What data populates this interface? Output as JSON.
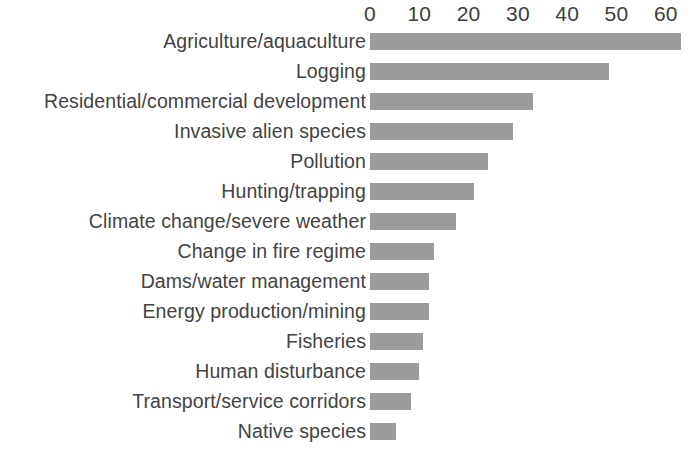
{
  "chart_data": {
    "type": "bar",
    "orientation": "horizontal",
    "title": "",
    "subtitle": "",
    "xlabel": "",
    "ylabel": "",
    "xlim": [
      0,
      63
    ],
    "x_ticks": [
      0,
      10,
      20,
      30,
      40,
      50,
      60
    ],
    "x_tick_labels": [
      "0",
      "10",
      "20",
      "30",
      "40",
      "50",
      "60"
    ],
    "grid": false,
    "legend": null,
    "bar_color": "#9c9c9c",
    "text_color": "#434343",
    "background_color": "#ffffff",
    "categories": [
      "Agriculture/aquaculture",
      "Logging",
      "Residential/commercial development",
      "Invasive alien species",
      "Pollution",
      "Hunting/trapping",
      "Climate change/severe weather",
      "Change in fire regime",
      "Dams/water management",
      "Energy production/mining",
      "Fisheries",
      "Human disturbance",
      "Transport/service corridors",
      "Native species"
    ],
    "values": [
      63,
      48.5,
      33,
      29,
      24,
      21,
      17.5,
      13,
      12,
      12,
      10.7,
      10,
      8.3,
      5.3
    ],
    "series": [
      {
        "name": "Threat frequency",
        "values": [
          63,
          48.5,
          33,
          29,
          24,
          21,
          17.5,
          13,
          12,
          12,
          10.7,
          10,
          8.3,
          5.3
        ]
      }
    ]
  }
}
